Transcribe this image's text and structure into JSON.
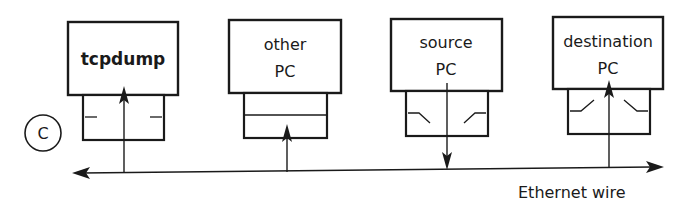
{
  "diagram": {
    "panel_marker": "C",
    "nodes": [
      {
        "id": "tcpdump",
        "label_line1": "tcpdump",
        "label_line2": "",
        "bold": true,
        "nic": "promiscuous",
        "arrow": "wire-to-host"
      },
      {
        "id": "other-pc",
        "label_line1": "other",
        "label_line2": "PC",
        "bold": false,
        "nic": "closed",
        "arrow": "wire-to-nic"
      },
      {
        "id": "source-pc",
        "label_line1": "source",
        "label_line2": "PC",
        "bold": false,
        "nic": "switch-open",
        "arrow": "host-to-wire"
      },
      {
        "id": "destination-pc",
        "label_line1": "destination",
        "label_line2": "PC",
        "bold": false,
        "nic": "switch-open",
        "arrow": "wire-to-host"
      }
    ],
    "wire": {
      "label": "Ethernet wire",
      "direction": "bidirectional"
    },
    "colors": {
      "stroke": "#1a1a1a",
      "background": "#ffffff"
    }
  }
}
